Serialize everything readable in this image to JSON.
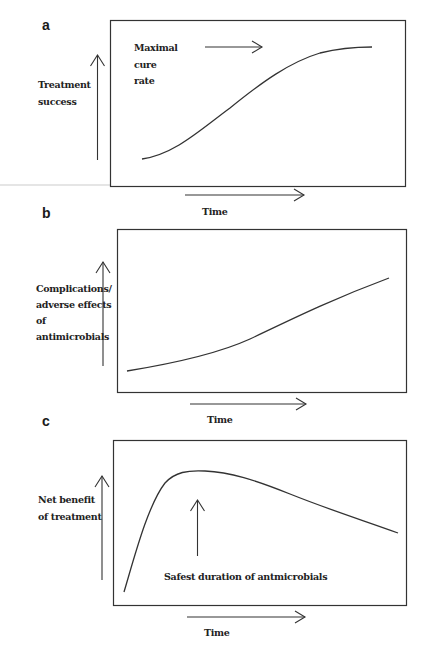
{
  "figure": {
    "panels": [
      {
        "letter": "a",
        "y_label_lines": [
          "Treatment",
          "success"
        ],
        "annotation_lines": [
          "Maximal",
          "cure",
          "rate"
        ],
        "x_label": "Time",
        "curve": "sigmoid rising to plateau"
      },
      {
        "letter": "b",
        "y_label_lines": [
          "Complications/",
          "adverse effects",
          "of",
          "antimicrobials"
        ],
        "x_label": "Time",
        "curve": "gradually increasing"
      },
      {
        "letter": "c",
        "y_label_lines": [
          "Net benefit",
          "of treatment"
        ],
        "annotation": "Safest duration of antmicrobials",
        "x_label": "Time",
        "curve": "steep rise to early peak then gradual decline"
      }
    ],
    "colors": {
      "stroke": "#333333",
      "text": "#222222",
      "background": "#ffffff"
    }
  }
}
